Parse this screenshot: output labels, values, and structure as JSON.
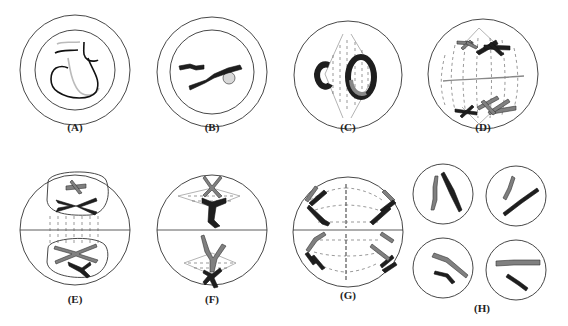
{
  "figure": {
    "panels": [
      {
        "id": "A",
        "label": "(A)",
        "cx": 75,
        "cy": 70,
        "label_x": 75,
        "label_y": 121
      },
      {
        "id": "B",
        "label": "(B)",
        "cx": 212,
        "cy": 72,
        "label_x": 212,
        "label_y": 121
      },
      {
        "id": "C",
        "label": "(C)",
        "cx": 348,
        "cy": 75,
        "label_x": 348,
        "label_y": 121
      },
      {
        "id": "D",
        "label": "(D)",
        "cx": 483,
        "cy": 74,
        "label_x": 483,
        "label_y": 121
      },
      {
        "id": "E",
        "label": "(E)",
        "cx": 75,
        "cy": 230,
        "label_x": 75,
        "label_y": 293
      },
      {
        "id": "F",
        "label": "(F)",
        "cx": 212,
        "cy": 230,
        "label_x": 212,
        "label_y": 293
      },
      {
        "id": "G",
        "label": "(G)",
        "cx": 348,
        "cy": 232,
        "label_x": 348,
        "label_y": 289
      },
      {
        "id": "H",
        "label": "(H)",
        "cx": 483,
        "cy": 232,
        "label_x": 482,
        "label_y": 302
      }
    ]
  },
  "colors": {
    "outline": "#333333",
    "chromosome_dark": "#1e1e1e",
    "chromosome_gray": "#777777",
    "spindle": "#555555"
  }
}
